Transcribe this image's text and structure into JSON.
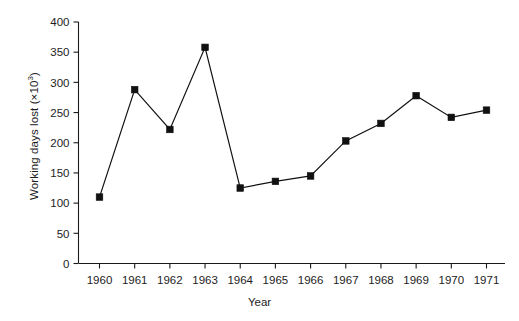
{
  "chart_data": {
    "type": "line",
    "title": "",
    "subtitle": "",
    "xlabel": "Year",
    "ylabel": "Working days lost (×10³)",
    "ylabel_base": "Working days lost (×10",
    "ylabel_exp": "3",
    "ylabel_tail": ")",
    "categories": [
      "1960",
      "1961",
      "1962",
      "1963",
      "1964",
      "1965",
      "1966",
      "1967",
      "1968",
      "1969",
      "1970",
      "1971"
    ],
    "x": [
      1960,
      1961,
      1962,
      1963,
      1964,
      1965,
      1966,
      1967,
      1968,
      1969,
      1970,
      1971
    ],
    "values": [
      110,
      288,
      222,
      358,
      125,
      136,
      145,
      203,
      232,
      278,
      242,
      254
    ],
    "series": [
      {
        "name": "Working days lost",
        "values": [
          110,
          288,
          222,
          358,
          125,
          136,
          145,
          203,
          232,
          278,
          242,
          254
        ]
      }
    ],
    "ylim": [
      0,
      400
    ],
    "yticks": [
      0,
      50,
      100,
      150,
      200,
      250,
      300,
      350,
      400
    ],
    "ytick_labels": [
      "0",
      "50",
      "100",
      "150",
      "200",
      "250",
      "300",
      "350",
      "400"
    ],
    "xtick_labels": [
      "1960",
      "1961",
      "1962",
      "1963",
      "1964",
      "1965",
      "1966",
      "1967",
      "1968",
      "1969",
      "1970",
      "1971"
    ],
    "grid": false,
    "legend": false,
    "legend_position": "none",
    "marker": "square",
    "line_color": "#111111",
    "marker_color": "#111111",
    "background_color": "#ffffff",
    "axis_color": "#1a1a1a"
  }
}
